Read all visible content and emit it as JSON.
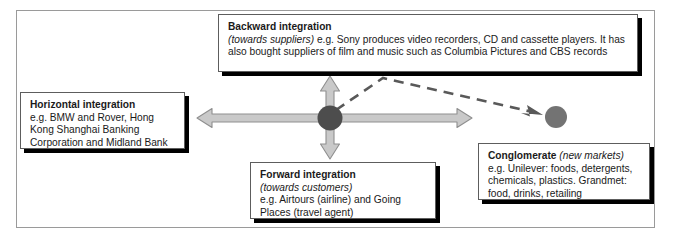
{
  "diagram": {
    "type": "integration-strategy-diagram",
    "frame": {
      "border_color": "#9a9a9a"
    },
    "hub": {
      "name": "central-hub",
      "color": "#4d4d4d",
      "center": [
        330,
        118
      ],
      "radius": 12
    },
    "secondary_node": {
      "name": "conglomerate-node",
      "color": "#737373",
      "center": [
        556,
        117
      ],
      "radius": 11
    },
    "arrows": {
      "fill": "#c9c9c9",
      "stroke": "#8f8f8f",
      "dashed_stroke": "#595959",
      "items": [
        {
          "name": "arrow-up",
          "direction": "up",
          "target": "Backward integration"
        },
        {
          "name": "arrow-left",
          "direction": "left",
          "target": "Horizontal integration"
        },
        {
          "name": "arrow-right",
          "direction": "right",
          "target": "Conglomerate"
        },
        {
          "name": "arrow-down",
          "direction": "down",
          "target": "Forward integration"
        },
        {
          "name": "arrow-dashed-diagonal",
          "direction": "diagonal",
          "target": "Conglomerate node"
        }
      ]
    },
    "boxes": {
      "backward": {
        "title": "Backward integration",
        "subtitle": "(towards suppliers)",
        "line1_rest": " e.g. Sony produces video recorders, CD and cassette players. It has",
        "line2": "also bought suppliers of film and music such as Columbia Pictures and CBS records"
      },
      "horizontal": {
        "title": "Horizontal integration",
        "line1": "e.g. BMW and Rover, Hong",
        "line2": "Kong Shanghai Banking",
        "line3": "Corporation and Midland Bank"
      },
      "forward": {
        "title": "Forward integration",
        "subtitle": "(towards customers)",
        "line1": "e.g. Airtours (airline) and Going",
        "line2": "Places (travel agent)"
      },
      "conglomerate": {
        "title": "Conglomerate",
        "subtitle": "(new markets)",
        "line1": "e.g. Unilever: foods, detergents,",
        "line2": "chemicals, plastics. Grandmet:",
        "line3": "food, drinks, retailing"
      }
    }
  }
}
